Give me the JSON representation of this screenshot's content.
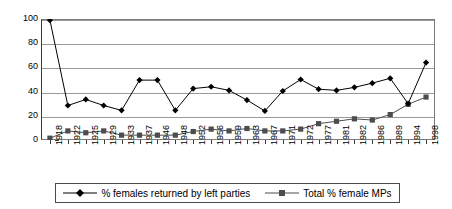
{
  "chart_data": {
    "type": "line",
    "title": "",
    "subtitle": "",
    "xlabel": "",
    "ylabel": "",
    "ylim": [
      0,
      100
    ],
    "ytick_step": 20,
    "yticks": [
      "0",
      "20",
      "40",
      "60",
      "80",
      "100"
    ],
    "grid": "horizontal",
    "legend_position": "bottom",
    "categories": [
      "1918",
      "1922",
      "1925",
      "1929",
      "1933",
      "1937",
      "1946",
      "1948",
      "1952",
      "1956",
      "1959",
      "1963",
      "1967",
      "1971",
      "1972",
      "1977",
      "1981",
      "1982",
      "1986",
      "1989",
      "1994",
      "1998"
    ],
    "series": [
      {
        "name": "% females returned by left parties",
        "marker": "diamond",
        "color": "#000000",
        "values": [
          99,
          28.5,
          33.5,
          28.5,
          24.5,
          49.5,
          49.5,
          24.5,
          42.5,
          44,
          41,
          33,
          24,
          40.5,
          50,
          42,
          41,
          43.5,
          47,
          51,
          30,
          64
        ]
      },
      {
        "name": "Total % female MPs",
        "marker": "square",
        "color": "#4d4d4d",
        "values": [
          1.5,
          7.5,
          6,
          7.5,
          4,
          4,
          4,
          4,
          7,
          9,
          7.5,
          9.5,
          7.5,
          7.5,
          9,
          13.5,
          15.5,
          17.5,
          16.5,
          21,
          29.5,
          35.5
        ]
      }
    ]
  },
  "legend": {
    "items": [
      {
        "label": "% females returned by left parties",
        "marker": "diamond-marker"
      },
      {
        "label": "Total % female MPs",
        "marker": "square-marker"
      }
    ]
  },
  "colors": {
    "series_left_parties": "#000000",
    "series_total_mps": "#4d4d4d",
    "gridline": "#9a9a9a",
    "axis": "#3a3a3a",
    "background": "#ffffff"
  }
}
